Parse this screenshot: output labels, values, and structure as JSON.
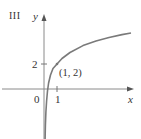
{
  "figure": {
    "panel_label": "III",
    "y_axis_label": "y",
    "x_axis_label": "x",
    "origin_label": "0",
    "x_tick_label": "1",
    "y_tick_label": "2",
    "point_label": "(1, 2)"
  },
  "curve": {
    "description": "logarithmic-type curve passing through (1, 2), vertical asymptote at x = 0",
    "point": [
      1,
      2
    ]
  },
  "colors": {
    "axis": "#8a8a8a",
    "curve": "#7a7a7a",
    "text": "#333333"
  }
}
